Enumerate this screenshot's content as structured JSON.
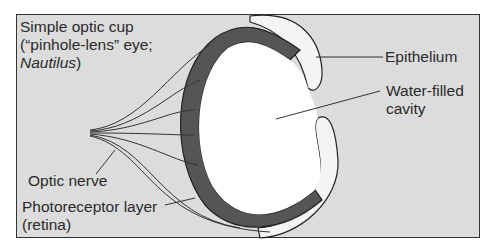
{
  "figure": {
    "title_line1": "Simple optic cup",
    "title_line2": "(“pinhole-lens” eye;",
    "title_species": "Nautilus",
    "title_close": ")"
  },
  "labels": {
    "epithelium": "Epithelium",
    "cavity_line1": "Water-filled",
    "cavity_line2": "cavity",
    "optic_nerve": "Optic nerve",
    "photoreceptor_line1": "Photoreceptor layer",
    "photoreceptor_line2": "(retina)"
  },
  "colors": {
    "background": "#dcdcdc",
    "frame": "#333333",
    "cavity": "#ffffff",
    "cell_dark": "#1a1a1a",
    "cell_gray": "#8a8a8a",
    "text": "#2a2a2a"
  }
}
